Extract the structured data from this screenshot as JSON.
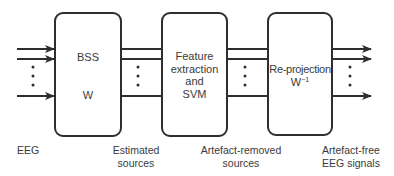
{
  "diagram": {
    "blocks": [
      {
        "id": "bss",
        "lines": [
          "BSS",
          "W"
        ]
      },
      {
        "id": "feature-svm",
        "lines": [
          "Feature",
          "extraction",
          "and",
          "SVM"
        ]
      },
      {
        "id": "reprojection",
        "title": "Re-projection",
        "matrix": "W",
        "exponent": "−1"
      }
    ],
    "labels": {
      "input": "EEG",
      "estimated": [
        "Estimated",
        "sources"
      ],
      "artefact_removed": [
        "Artefact-removed",
        "sources"
      ],
      "output": [
        "Artefact-free",
        "EEG signals"
      ]
    },
    "continuation_symbol": "⋮",
    "colors": {
      "stroke": "#2e2e2e",
      "text": "#3a3a3a",
      "background": "#ffffff"
    }
  }
}
